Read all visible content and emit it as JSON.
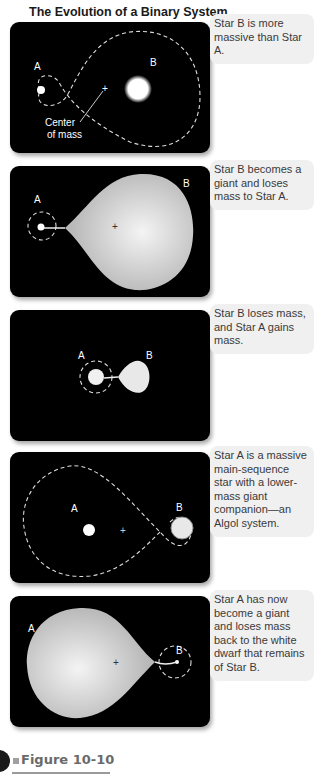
{
  "title": "The Evolution of a Binary System",
  "colors": {
    "panel_bg": "#000000",
    "callout_bg": "#f0f0f0",
    "star": "#ffffff",
    "giant": "#d8d8d8",
    "orbit": "#ffffff"
  },
  "panels": [
    {
      "caption": "Star B is more massive than Star A.",
      "label_a": "A",
      "label_b": "B",
      "annotation": "Center of mass",
      "annotation_line1": "Center",
      "annotation_line2": "of mass"
    },
    {
      "caption": "Star B becomes a giant and loses mass to Star A.",
      "label_a": "A",
      "label_b": "B"
    },
    {
      "caption": "Star B loses mass, and Star A gains mass.",
      "label_a": "A",
      "label_b": "B"
    },
    {
      "caption": "Star A is a massive main-sequence star with a lower-mass giant companion—an Algol system.",
      "label_a": "A",
      "label_b": "B"
    },
    {
      "caption": "Star A has now become a giant and loses mass back to the white dwarf that remains of Star B.",
      "label_a": "A",
      "label_b": "B"
    }
  ],
  "figure_label": "Figure 10-10"
}
